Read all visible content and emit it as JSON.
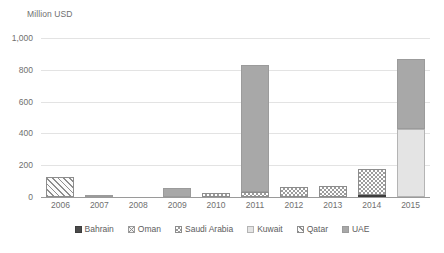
{
  "chart_data": {
    "type": "bar",
    "title": "",
    "subtitle": "",
    "axis_title": "Million USD",
    "xlabel": "",
    "ylabel": "Million USD",
    "stacked": true,
    "grid": true,
    "legend_position": "bottom",
    "ylim": [
      0,
      1000
    ],
    "yticks": [
      0,
      200,
      400,
      600,
      800,
      1000
    ],
    "ytick_labels": [
      "0",
      "200",
      "400",
      "600",
      "800",
      "1,000"
    ],
    "categories": [
      "2006",
      "2007",
      "2008",
      "2009",
      "2010",
      "2011",
      "2012",
      "2013",
      "2014",
      "2015"
    ],
    "series": [
      {
        "name": "Bahrain",
        "pattern": "solid-dark",
        "color": "#4a4a4a",
        "values": [
          0,
          0,
          0,
          0,
          0,
          0,
          0,
          0,
          15,
          0
        ]
      },
      {
        "name": "Oman",
        "pattern": "cross-hatch",
        "color": "#8e8e8e",
        "values": [
          0,
          0,
          0,
          0,
          0,
          0,
          0,
          0,
          0,
          0
        ]
      },
      {
        "name": "Saudi Arabia",
        "pattern": "checkerboard",
        "color": "#9c9c9c",
        "values": [
          0,
          0,
          0,
          0,
          25,
          30,
          60,
          70,
          160,
          0
        ]
      },
      {
        "name": "Kuwait",
        "pattern": "light-solid",
        "color": "#e4e4e4",
        "values": [
          0,
          0,
          0,
          0,
          0,
          0,
          0,
          0,
          0,
          425
        ]
      },
      {
        "name": "Qatar",
        "pattern": "diagonal-hatch",
        "color": "#8e8e8e",
        "values": [
          125,
          0,
          0,
          0,
          0,
          0,
          0,
          0,
          0,
          0
        ]
      },
      {
        "name": "UAE",
        "pattern": "gray-solid",
        "color": "#a8a8a8",
        "values": [
          0,
          12,
          0,
          58,
          0,
          800,
          0,
          0,
          0,
          440
        ]
      }
    ],
    "totals": [
      125,
      12,
      0,
      58,
      25,
      830,
      60,
      70,
      175,
      865
    ]
  },
  "legend": {
    "items": [
      {
        "label": "Bahrain",
        "swatch": "solid-dark-swatch"
      },
      {
        "label": "Oman",
        "swatch": "cross-hatch-swatch"
      },
      {
        "label": "Saudi Arabia",
        "swatch": "checkerboard-swatch"
      },
      {
        "label": "Kuwait",
        "swatch": "light-solid-swatch"
      },
      {
        "label": "Qatar",
        "swatch": "diagonal-hatch-swatch"
      },
      {
        "label": "UAE",
        "swatch": "gray-solid-swatch"
      }
    ]
  },
  "colors": {
    "background": "#ffffff",
    "gridline": "#e3e3e3",
    "axis": "#9a9a9a",
    "text": "#6f6f6f"
  }
}
